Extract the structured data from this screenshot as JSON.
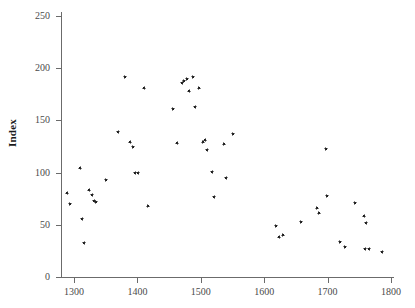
{
  "chart_data": {
    "type": "scatter",
    "title": "",
    "xlabel": "",
    "ylabel": "Index",
    "xlim": [
      1283,
      1807
    ],
    "ylim": [
      -8,
      258
    ],
    "xticks": [
      1300,
      1400,
      1500,
      1600,
      1700,
      1800
    ],
    "yticks": [
      0,
      50,
      100,
      150,
      200,
      250
    ],
    "xtick_labels": [
      "1300",
      "1400",
      "1500",
      "1600",
      "1700",
      "1800"
    ],
    "ytick_labels": [
      "0",
      "50",
      "100",
      "150",
      "200",
      "250"
    ],
    "grid": false,
    "legend": null,
    "marker": "dot",
    "marker_color": "#1c1c1c",
    "n_points": 57,
    "points": [
      {
        "x": 1289,
        "y": 80
      },
      {
        "x": 1293,
        "y": 70
      },
      {
        "x": 1310,
        "y": 104
      },
      {
        "x": 1313,
        "y": 56
      },
      {
        "x": 1316,
        "y": 33
      },
      {
        "x": 1324,
        "y": 83
      },
      {
        "x": 1329,
        "y": 79
      },
      {
        "x": 1332,
        "y": 73
      },
      {
        "x": 1334,
        "y": 72
      },
      {
        "x": 1350,
        "y": 93
      },
      {
        "x": 1370,
        "y": 139
      },
      {
        "x": 1380,
        "y": 192
      },
      {
        "x": 1389,
        "y": 129
      },
      {
        "x": 1393,
        "y": 125
      },
      {
        "x": 1397,
        "y": 100
      },
      {
        "x": 1401,
        "y": 100
      },
      {
        "x": 1411,
        "y": 181
      },
      {
        "x": 1416,
        "y": 68
      },
      {
        "x": 1456,
        "y": 161
      },
      {
        "x": 1463,
        "y": 128
      },
      {
        "x": 1471,
        "y": 186
      },
      {
        "x": 1473,
        "y": 188
      },
      {
        "x": 1478,
        "y": 190
      },
      {
        "x": 1482,
        "y": 178
      },
      {
        "x": 1487,
        "y": 192
      },
      {
        "x": 1491,
        "y": 163
      },
      {
        "x": 1497,
        "y": 181
      },
      {
        "x": 1503,
        "y": 129
      },
      {
        "x": 1507,
        "y": 131
      },
      {
        "x": 1510,
        "y": 122
      },
      {
        "x": 1518,
        "y": 101
      },
      {
        "x": 1521,
        "y": 77
      },
      {
        "x": 1536,
        "y": 127
      },
      {
        "x": 1540,
        "y": 95
      },
      {
        "x": 1550,
        "y": 137
      },
      {
        "x": 1618,
        "y": 49
      },
      {
        "x": 1624,
        "y": 38
      },
      {
        "x": 1629,
        "y": 40
      },
      {
        "x": 1658,
        "y": 53
      },
      {
        "x": 1683,
        "y": 66
      },
      {
        "x": 1686,
        "y": 61
      },
      {
        "x": 1697,
        "y": 123
      },
      {
        "x": 1699,
        "y": 78
      },
      {
        "x": 1719,
        "y": 34
      },
      {
        "x": 1727,
        "y": 29
      },
      {
        "x": 1743,
        "y": 71
      },
      {
        "x": 1758,
        "y": 58
      },
      {
        "x": 1759,
        "y": 27
      },
      {
        "x": 1761,
        "y": 52
      },
      {
        "x": 1766,
        "y": 27
      },
      {
        "x": 1786,
        "y": 24
      }
    ]
  },
  "axes": {
    "y_title": "Index"
  }
}
